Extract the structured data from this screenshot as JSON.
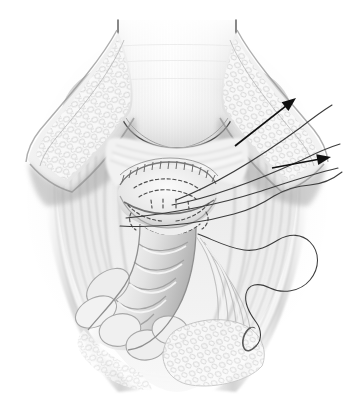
{
  "figure": {
    "title": "Surgical illustration: vesicourethral anastomosis with traction sutures",
    "domain": "medical-illustration",
    "style": "grayscale pencil / airbrush rendering",
    "border_color": "#e4e4e4",
    "background_color": "#ffffff",
    "canvas": {
      "width": 354,
      "height": 406
    },
    "frame": {
      "x": 14,
      "y": 12,
      "width": 326,
      "height": 382
    }
  },
  "palette": {
    "outline": "#3a3a3a",
    "arrow": "#111111",
    "suture_thread": "#4a4a4a",
    "dashed_suture": "#555555",
    "tissue_light": "#f6f6f6",
    "tissue_mid": "#d8d8d8",
    "tissue_shadow": "#a8a8a8",
    "tissue_dark": "#8a8a8a",
    "fat_outline": "#b9b9b9",
    "needle": "#5a5a5a"
  },
  "structures": [
    {
      "name": "bladder-neck",
      "label": "Bladder / retracted superior structure",
      "position": "top center",
      "description": "Large rounded smooth organ at top center with faint vertical striations"
    },
    {
      "name": "anastomosis-site",
      "label": "Anastomosis site",
      "position": "center",
      "description": "Central opening with crenulated upper margin and dashed suture placements"
    },
    {
      "name": "fat-flap-left",
      "label": "Retracted adipose tissue flap (left)",
      "position": "upper left",
      "description": "Lobulated fatty tissue along a diagonal retracted edge"
    },
    {
      "name": "fat-flap-right",
      "label": "Retracted adipose tissue flap (right)",
      "position": "upper right",
      "description": "Lobulated fatty tissue along a diagonal retracted edge"
    },
    {
      "name": "urethral-stump",
      "label": "Urethral stump / tubular structure",
      "position": "lower center",
      "description": "Segmented tubular structure descending toward lower left"
    },
    {
      "name": "pelvic-floor-muscle",
      "label": "Pelvic floor musculature",
      "position": "lower and lateral",
      "description": "Longitudinal striated muscle fibres framing the field"
    }
  ],
  "annotations": {
    "arrows": [
      {
        "name": "traction-arrow-upper",
        "label": "Traction direction (upper suture)",
        "from": [
          235,
          146
        ],
        "to": [
          296,
          98
        ],
        "direction": "up-right"
      },
      {
        "name": "traction-arrow-lower",
        "label": "Traction direction (lower suture)",
        "from": [
          272,
          168
        ],
        "to": [
          331,
          157
        ],
        "direction": "up-right"
      }
    ],
    "suture_threads": [
      {
        "name": "traction-suture-1",
        "label": "Traction suture exiting superolaterally",
        "path_note": "from anastomosis center to upper right edge"
      },
      {
        "name": "traction-suture-2",
        "label": "Second traction suture",
        "path_note": "parallel, exiting upper right edge"
      },
      {
        "name": "traction-suture-3",
        "label": "Third traction suture",
        "path_note": "crosses field, exits right edge"
      },
      {
        "name": "free-suture-with-needle",
        "label": "Free suture with curved needle",
        "path_note": "serpentine loop in lower right with curved needle at its end"
      }
    ],
    "dashed_sutures": {
      "name": "placed-suture-bites",
      "label": "Placed but untied suture bites (shown dashed)",
      "count": 7,
      "location": "anastomotic ring, center of field"
    },
    "needle": {
      "name": "curved-surgical-needle",
      "label": "Curved surgical needle",
      "position": [
        252,
        332
      ]
    }
  },
  "text_labels": []
}
